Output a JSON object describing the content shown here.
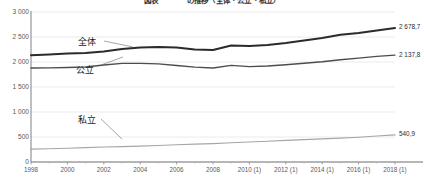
{
  "chart_data": {
    "type": "line",
    "title": "図表　　　　の推移（全体・公立・私立）",
    "xlabel": "",
    "ylabel": "",
    "ylim": [
      0,
      3000
    ],
    "ytick_values": [
      0,
      500,
      1000,
      1500,
      2000,
      2500,
      3000
    ],
    "ytick_labels": [
      "0",
      "500",
      "1 000",
      "1 500",
      "2 000",
      "2 500",
      "3 000"
    ],
    "grid": true,
    "legend_position": "inline-annotations",
    "x": [
      1998,
      1999,
      2000,
      2001,
      2002,
      2003,
      2004,
      2005,
      2006,
      2007,
      2008,
      2009,
      2010,
      2011,
      2012,
      2013,
      2014,
      2015,
      2016,
      2017,
      2018
    ],
    "xtick_values": [
      1998,
      2000,
      2002,
      2004,
      2006,
      2008,
      2010,
      2012,
      2014,
      2016,
      2018
    ],
    "xtick_labels": [
      "1998",
      "2000",
      "2002",
      "2004",
      "2006",
      "2008",
      "2010 (1)",
      "2012 (1)",
      "2014 (1)",
      "2016 (1)",
      "2018 (1)"
    ],
    "series": [
      {
        "name": "全体",
        "color": "#2b2b2b",
        "width": 2.0,
        "end_label": "2 678,7",
        "values": [
          2137,
          2150,
          2168,
          2180,
          2210,
          2258,
          2288,
          2298,
          2292,
          2248,
          2241,
          2330,
          2318,
          2340,
          2380,
          2430,
          2480,
          2545,
          2580,
          2630,
          2678.7
        ]
      },
      {
        "name": "公立",
        "color": "#4d4d4d",
        "width": 1.35,
        "end_label": "2 137,8",
        "values": [
          1880,
          1882,
          1890,
          1900,
          1940,
          1972,
          1972,
          1962,
          1930,
          1898,
          1880,
          1932,
          1908,
          1920,
          1945,
          1975,
          2005,
          2045,
          2078,
          2112,
          2137.8
        ]
      },
      {
        "name": "私立",
        "color": "#a6a6a6",
        "width": 1.2,
        "end_label": "540,9",
        "values": [
          258,
          265,
          275,
          288,
          300,
          308,
          318,
          330,
          345,
          358,
          368,
          385,
          400,
          415,
          432,
          448,
          462,
          478,
          495,
          520,
          540.9
        ]
      }
    ],
    "annotations": [
      {
        "text": "全体",
        "x_px": 78,
        "y_px": 38
      },
      {
        "text": "公立",
        "x_px": 76,
        "y_px": 66
      },
      {
        "text": "私立",
        "x_px": 78,
        "y_px": 116
      }
    ]
  },
  "axis": {
    "y_axis_name": "y-axis",
    "x_axis_name": "x-axis"
  }
}
